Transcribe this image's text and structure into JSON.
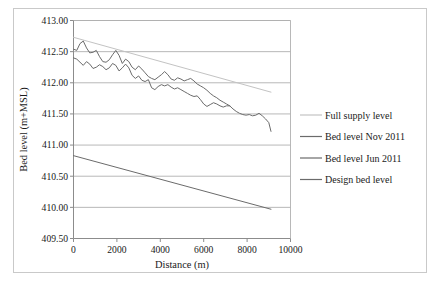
{
  "chart_data": {
    "type": "line",
    "title": "",
    "xlabel": "Distance (m)",
    "ylabel": "Bed level (m+MSL)",
    "xlim": [
      0,
      10000
    ],
    "ylim": [
      409.5,
      413.0
    ],
    "xticks": [
      "0",
      "2000",
      "4000",
      "6000",
      "8000",
      "10000"
    ],
    "xtick_values": [
      0,
      2000,
      4000,
      6000,
      8000,
      10000
    ],
    "yticks": [
      "409.50",
      "410.00",
      "410.50",
      "411.00",
      "411.50",
      "412.00",
      "412.50",
      "413.00"
    ],
    "ytick_values": [
      409.5,
      410.0,
      410.5,
      411.0,
      411.5,
      412.0,
      412.5,
      413.0
    ],
    "grid": "horizontal",
    "legend_position": "right",
    "series": [
      {
        "name": "Full supply level",
        "color": "#c3c3c3",
        "width": 1.0,
        "x": [
          0,
          9100
        ],
        "values": [
          412.73,
          411.85
        ]
      },
      {
        "name": "Bed level Nov 2011",
        "color": "#6b6b6b",
        "width": 1.0,
        "x": [
          0,
          150,
          300,
          450,
          600,
          750,
          900,
          1050,
          1200,
          1350,
          1500,
          1650,
          1800,
          1950,
          2100,
          2250,
          2400,
          2550,
          2700,
          2850,
          3000,
          3150,
          3300,
          3450,
          3600,
          3750,
          3900,
          4050,
          4200,
          4350,
          4500,
          4650,
          4800,
          4950,
          5100,
          5250,
          5400,
          5550,
          5700,
          5850,
          6000,
          6150,
          6300,
          6450,
          6600,
          6750,
          6900,
          7050,
          7200,
          7350,
          7500,
          7650,
          7800,
          7950,
          8100,
          8250,
          8400,
          8550,
          8700,
          8850,
          9000,
          9100
        ],
        "values": [
          412.54,
          412.52,
          412.63,
          412.67,
          412.56,
          412.48,
          412.49,
          412.52,
          412.42,
          412.34,
          412.33,
          412.37,
          412.45,
          412.52,
          412.44,
          412.31,
          412.38,
          412.34,
          412.25,
          412.21,
          412.27,
          412.22,
          412.16,
          412.1,
          412.07,
          412.05,
          412.09,
          412.13,
          412.18,
          412.13,
          412.06,
          412.04,
          412.08,
          412.06,
          412.03,
          412.05,
          412.07,
          412.03,
          411.98,
          411.95,
          411.92,
          411.88,
          411.83,
          411.79,
          411.76,
          411.72,
          411.69,
          411.66,
          411.63,
          411.58,
          411.54,
          411.51,
          411.49,
          411.48,
          411.49,
          411.47,
          411.48,
          411.51,
          411.47,
          411.42,
          411.36,
          411.22
        ]
      },
      {
        "name": "Bed level Jun 2011",
        "color": "#6b6b6b",
        "width": 1.0,
        "x": [
          0,
          150,
          300,
          450,
          600,
          750,
          900,
          1050,
          1200,
          1350,
          1500,
          1650,
          1800,
          1950,
          2100,
          2250,
          2400,
          2550,
          2700,
          2850,
          3000,
          3150,
          3300,
          3450,
          3600,
          3750,
          3900,
          4050,
          4200,
          4350,
          4500,
          4650,
          4800,
          4950,
          5100,
          5250,
          5400,
          5550,
          5700,
          5850,
          6000,
          6150,
          6300,
          6450,
          6600,
          6750,
          6900,
          7050,
          7200
        ],
        "values": [
          412.4,
          412.38,
          412.33,
          412.28,
          412.34,
          412.3,
          412.23,
          412.25,
          412.29,
          412.26,
          412.21,
          412.24,
          412.31,
          412.28,
          412.19,
          412.24,
          412.3,
          412.24,
          412.12,
          412.07,
          412.11,
          412.04,
          412.02,
          412.05,
          411.92,
          411.89,
          411.94,
          411.97,
          411.95,
          411.97,
          411.93,
          411.9,
          411.92,
          411.89,
          411.86,
          411.83,
          411.8,
          411.78,
          411.79,
          411.73,
          411.66,
          411.62,
          411.65,
          411.68,
          411.66,
          411.63,
          411.61,
          411.63,
          411.63
        ]
      },
      {
        "name": "Design bed level",
        "color": "#6b6b6b",
        "width": 1.0,
        "x": [
          0,
          9100
        ],
        "values": [
          410.83,
          409.97
        ]
      }
    ],
    "legend_entries": [
      {
        "label": "Full supply level",
        "color": "#c3c3c3"
      },
      {
        "label": "Bed level Nov 2011",
        "color": "#6b6b6b"
      },
      {
        "label": "Bed level Jun 2011",
        "color": "#6b6b6b"
      },
      {
        "label": "Design bed level",
        "color": "#6b6b6b"
      }
    ],
    "colors": {
      "gridline": "#b0b0b0",
      "axis": "#8c8c8c",
      "frame": "#c9c9c9",
      "background": "#ffffff",
      "text": "#1a1a1a"
    }
  }
}
